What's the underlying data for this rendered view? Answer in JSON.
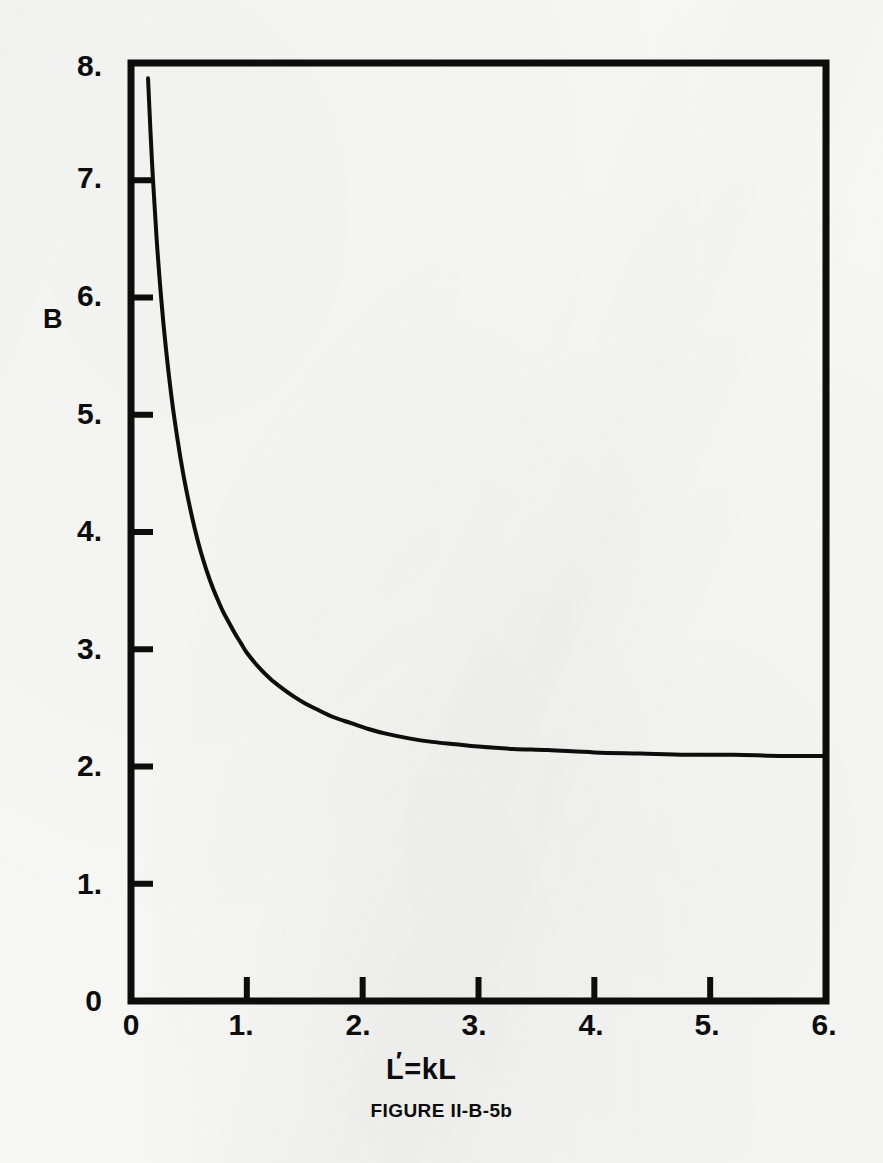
{
  "figure": {
    "caption": "FIGURE II-B-5b",
    "ink_color": "#0d0d0d",
    "paper_color": "#f6f6f4"
  },
  "axes": {
    "y_title": "B",
    "x_title_prefix": "L",
    "x_title_suffix": "=kL",
    "x_title_full": "L'=kL",
    "y_ticks": [
      "0",
      "1.",
      "2.",
      "3.",
      "4.",
      "5.",
      "6.",
      "7.",
      "8."
    ],
    "x_ticks": [
      "0",
      "1.",
      "2.",
      "3.",
      "4.",
      "5.",
      "6."
    ]
  },
  "chart_data": {
    "type": "line",
    "title": "FIGURE II-B-5b",
    "xlabel": "L'=kL",
    "ylabel": "B",
    "xlim": [
      0,
      6
    ],
    "ylim": [
      0,
      8
    ],
    "xticks": [
      0,
      1,
      2,
      3,
      4,
      5,
      6
    ],
    "yticks": [
      0,
      1,
      2,
      3,
      4,
      5,
      6,
      7,
      8
    ],
    "xtick_labels": [
      "0",
      "1.",
      "2.",
      "3.",
      "4.",
      "5.",
      "6."
    ],
    "ytick_labels": [
      "0",
      "1.",
      "2.",
      "3.",
      "4.",
      "5.",
      "6.",
      "7.",
      "8."
    ],
    "grid": false,
    "legend": null,
    "series": [
      {
        "name": "B vs L'",
        "line_color": "#0d0d0d",
        "line_width": 4,
        "x": [
          0.147,
          0.18,
          0.22,
          0.26,
          0.3,
          0.35,
          0.4,
          0.45,
          0.5,
          0.55,
          0.6,
          0.65,
          0.7,
          0.75,
          0.8,
          0.85,
          0.9,
          0.95,
          1.0,
          1.1,
          1.2,
          1.3,
          1.4,
          1.5,
          1.6,
          1.75,
          1.9,
          2.05,
          2.2,
          2.4,
          2.6,
          2.8,
          3.0,
          3.3,
          3.6,
          4.0,
          4.4,
          4.8,
          5.2,
          5.6,
          6.0
        ],
        "y": [
          7.87,
          7.18,
          6.52,
          6.0,
          5.58,
          5.15,
          4.8,
          4.5,
          4.25,
          4.03,
          3.84,
          3.68,
          3.54,
          3.42,
          3.31,
          3.22,
          3.13,
          3.05,
          2.97,
          2.85,
          2.75,
          2.67,
          2.6,
          2.54,
          2.49,
          2.42,
          2.37,
          2.32,
          2.28,
          2.24,
          2.21,
          2.19,
          2.17,
          2.15,
          2.14,
          2.12,
          2.11,
          2.1,
          2.1,
          2.09,
          2.09
        ]
      }
    ]
  },
  "geometry": {
    "plot_left_px": 131,
    "plot_right_px": 826,
    "plot_top_px": 63,
    "plot_bottom_px": 1001
  }
}
